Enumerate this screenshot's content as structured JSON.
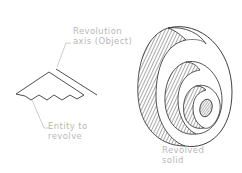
{
  "diagram": {
    "labels": {
      "axis_line1": "Revolution",
      "axis_line2": "axis (Object)",
      "entity_line1": "Entity to",
      "entity_line2": "revolve",
      "solid_line1": "Revolved",
      "solid_line2": "solid"
    },
    "colors": {
      "line": "#3a3a3a",
      "leader": "#bdbdbd",
      "label": "#b8b8b8",
      "background": "#ffffff"
    }
  }
}
